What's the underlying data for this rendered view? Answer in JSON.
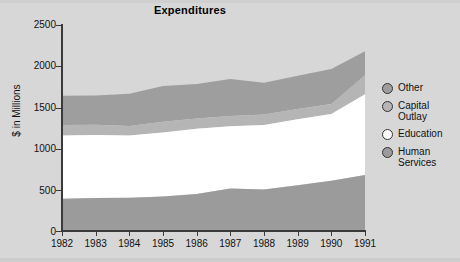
{
  "chart_data": {
    "type": "area",
    "title": "Expenditures",
    "xlabel": "",
    "ylabel": "$ in Millions",
    "stacked": true,
    "grid": false,
    "legend_position": "right",
    "categories": [
      "1982",
      "1983",
      "1984",
      "1985",
      "1986",
      "1987",
      "1988",
      "1989",
      "1990",
      "1991"
    ],
    "x": [
      1982,
      1983,
      1984,
      1985,
      1986,
      1987,
      1988,
      1989,
      1990,
      1991
    ],
    "xlim": [
      1982,
      1991
    ],
    "ylim": [
      0,
      2500
    ],
    "yticks": [
      0,
      500,
      1000,
      1500,
      2000,
      2500
    ],
    "ytick_labels": [
      "0",
      "500",
      "1000",
      "1500",
      "2000",
      "2500"
    ],
    "series": [
      {
        "name": "Human Services",
        "color": "#9b9b9b",
        "values": [
          390,
          400,
          405,
          420,
          450,
          515,
          505,
          555,
          610,
          680
        ]
      },
      {
        "name": "Education",
        "color": "#ffffff",
        "values": [
          770,
          765,
          755,
          775,
          790,
          755,
          780,
          800,
          810,
          980
        ]
      },
      {
        "name": "Capital Outlay",
        "color": "#b5b5b5",
        "values": [
          125,
          125,
          115,
          130,
          125,
          125,
          130,
          125,
          120,
          230
        ]
      },
      {
        "name": "Other",
        "color": "#9e9e9e",
        "values": [
          355,
          355,
          390,
          435,
          420,
          450,
          385,
          405,
          425,
          290
        ]
      }
    ],
    "cumulative_tops": {
      "human_services": [
        390,
        400,
        405,
        420,
        450,
        515,
        505,
        555,
        610,
        680
      ],
      "education": [
        1160,
        1165,
        1160,
        1195,
        1240,
        1270,
        1285,
        1355,
        1420,
        1660
      ],
      "capital_outlay": [
        1285,
        1290,
        1275,
        1325,
        1365,
        1395,
        1415,
        1480,
        1540,
        1890
      ],
      "total": [
        1640,
        1645,
        1665,
        1760,
        1785,
        1845,
        1800,
        1885,
        1965,
        2180
      ]
    }
  },
  "legend": {
    "items": [
      {
        "label": "Other",
        "marker": "circle-gray",
        "color": "#9e9e9e"
      },
      {
        "label": "Capital\nOutlay",
        "marker": "circle-lightgray",
        "color": "#b5b5b5"
      },
      {
        "label": "Education",
        "marker": "circle-white",
        "color": "#ffffff"
      },
      {
        "label": "Human\nServices",
        "marker": "circle-darkgray",
        "color": "#9b9b9b"
      }
    ]
  },
  "colors": {
    "background": "#d7d7d7",
    "axis": "#3a3a3a",
    "text": "#111111"
  }
}
